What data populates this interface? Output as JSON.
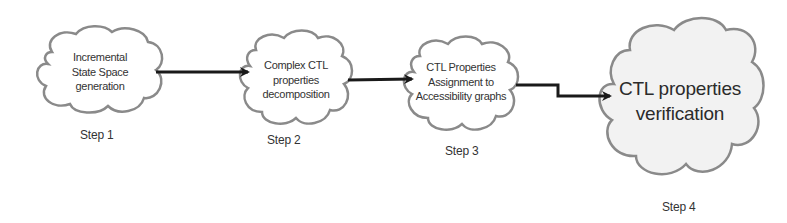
{
  "diagram": {
    "type": "flow",
    "direction": "left-to-right",
    "colors": {
      "cloud_stroke": "#8a8a8a",
      "cloud_fill": "#ffffff",
      "cloud_fill_final": "#f2f2f2",
      "arrow": "#1a1a1a",
      "text": "#333333"
    },
    "nodes": [
      {
        "id": "step1",
        "shape": "cloud",
        "lines": [
          "Incremental",
          "State Space",
          "generation"
        ],
        "step_label": "Step 1"
      },
      {
        "id": "step2",
        "shape": "cloud",
        "lines": [
          "Complex CTL",
          "properties",
          "decomposition"
        ],
        "step_label": "Step 2"
      },
      {
        "id": "step3",
        "shape": "cloud",
        "lines": [
          "CTL Properties",
          "Assignment to",
          "Accessibility graphs"
        ],
        "step_label": "Step 3"
      },
      {
        "id": "step4",
        "shape": "cloud",
        "lines": [
          "CTL properties",
          "verification"
        ],
        "step_label": "Step 4"
      }
    ],
    "edges": [
      {
        "from": "step1",
        "to": "step2",
        "style": "straight"
      },
      {
        "from": "step2",
        "to": "step3",
        "style": "straight"
      },
      {
        "from": "step3",
        "to": "step4",
        "style": "elbow"
      }
    ]
  }
}
